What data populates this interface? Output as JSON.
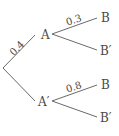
{
  "diagram": {
    "type": "probability-tree",
    "color": "#555555",
    "nodes": {
      "root": {
        "label": ""
      },
      "a": {
        "label": "A"
      },
      "a_prime": {
        "label": "A′"
      },
      "a_b": {
        "label": "B"
      },
      "a_b_prime": {
        "label": "B′"
      },
      "ap_b": {
        "label": "B"
      },
      "ap_b_prime": {
        "label": "B′"
      }
    },
    "edges": {
      "root_a": {
        "from": "root",
        "to": "A",
        "probability": "0.4"
      },
      "root_a_prime": {
        "from": "root",
        "to": "A′",
        "probability": ""
      },
      "a_b": {
        "from": "A",
        "to": "B",
        "probability": "0.3"
      },
      "a_b_prime": {
        "from": "A",
        "to": "B′",
        "probability": ""
      },
      "ap_b": {
        "from": "A′",
        "to": "B",
        "probability": "0.8"
      },
      "ap_b_prime": {
        "from": "A′",
        "to": "B′",
        "probability": ""
      }
    }
  }
}
